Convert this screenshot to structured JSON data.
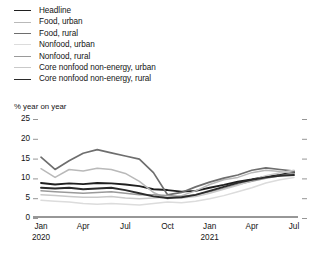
{
  "legend": {
    "items": [
      {
        "label": "Headline",
        "color": "#1f1f1f",
        "width": 1.9
      },
      {
        "label": "Food, urban",
        "color": "#b9b9b9",
        "width": 1.5
      },
      {
        "label": "Food, rural",
        "color": "#6e6e6e",
        "width": 1.7
      },
      {
        "label": "Nonfood, urban",
        "color": "#dcdcdc",
        "width": 1.5
      },
      {
        "label": "Nonfood, rural",
        "color": "#9a9a9a",
        "width": 1.5
      },
      {
        "label": "Core nonfood non-energy, urban",
        "color": "#c9c9c9",
        "width": 1.5
      },
      {
        "label": "Core nonfood non-energy, rural",
        "color": "#2b2b2b",
        "width": 1.9
      }
    ]
  },
  "chart_data": {
    "type": "line",
    "title": "",
    "subtitle": "",
    "ylabel": "% year on year",
    "xlabel": "",
    "ylim": [
      0,
      25
    ],
    "yticks": [
      0,
      5,
      10,
      15,
      20,
      25
    ],
    "grid": false,
    "legend_position": "top-left",
    "x": [
      "Jan 2020",
      "Feb 2020",
      "Mar 2020",
      "Apr 2020",
      "May 2020",
      "Jun 2020",
      "Jul 2020",
      "Aug 2020",
      "Sep 2020",
      "Oct 2020",
      "Nov 2020",
      "Dec 2020",
      "Jan 2021",
      "Feb 2021",
      "Mar 2021",
      "Apr 2021",
      "May 2021",
      "Jun 2021",
      "Jul 2021"
    ],
    "xtick_labels": [
      {
        "top": "Jan",
        "bottom": "2020",
        "index": 0
      },
      {
        "top": "Apr",
        "bottom": "",
        "index": 3
      },
      {
        "top": "Jul",
        "bottom": "",
        "index": 6
      },
      {
        "top": "Oct",
        "bottom": "",
        "index": 9
      },
      {
        "top": "Jan",
        "bottom": "2021",
        "index": 12
      },
      {
        "top": "Apr",
        "bottom": "",
        "index": 15
      },
      {
        "top": "Jul",
        "bottom": "",
        "index": 18
      }
    ],
    "series": [
      {
        "name": "Headline",
        "color": "#1f1f1f",
        "width": 1.9,
        "values": [
          8.6,
          8.2,
          8.5,
          8.3,
          8.6,
          8.5,
          8.2,
          7.8,
          7.0,
          6.8,
          6.4,
          6.6,
          7.4,
          8.1,
          8.9,
          9.5,
          10.2,
          10.6,
          11.3
        ]
      },
      {
        "name": "Food, urban",
        "color": "#b9b9b9",
        "width": 1.5,
        "values": [
          12.2,
          10.0,
          12.0,
          11.6,
          12.3,
          12.0,
          11.0,
          9.0,
          6.2,
          4.6,
          5.4,
          6.6,
          8.2,
          9.4,
          10.0,
          11.2,
          11.8,
          11.5,
          11.0
        ]
      },
      {
        "name": "Food, rural",
        "color": "#6e6e6e",
        "width": 1.7,
        "values": [
          15.1,
          12.0,
          14.2,
          16.1,
          17.0,
          16.2,
          15.4,
          14.6,
          11.2,
          5.6,
          6.2,
          7.6,
          8.8,
          9.8,
          10.6,
          11.8,
          12.4,
          12.0,
          11.6
        ]
      },
      {
        "name": "Nonfood, urban",
        "color": "#dcdcdc",
        "width": 1.5,
        "values": [
          4.2,
          4.0,
          3.8,
          3.4,
          3.2,
          3.4,
          3.2,
          3.0,
          3.4,
          3.8,
          3.6,
          4.0,
          4.6,
          5.4,
          6.4,
          7.4,
          8.6,
          9.4,
          10.0
        ]
      },
      {
        "name": "Nonfood, rural",
        "color": "#9a9a9a",
        "width": 1.5,
        "values": [
          6.6,
          6.4,
          6.2,
          6.0,
          6.2,
          6.4,
          6.0,
          5.6,
          5.6,
          5.4,
          5.2,
          5.6,
          6.4,
          7.2,
          8.2,
          9.0,
          9.8,
          10.4,
          11.0
        ]
      },
      {
        "name": "Core nonfood non-energy, urban",
        "color": "#c9c9c9",
        "width": 1.5,
        "values": [
          5.6,
          5.4,
          5.2,
          5.0,
          5.0,
          5.2,
          4.8,
          4.6,
          4.8,
          5.0,
          4.8,
          5.2,
          6.0,
          7.0,
          8.0,
          9.2,
          10.4,
          11.2,
          11.8
        ]
      },
      {
        "name": "Core nonfood non-energy, rural",
        "color": "#2b2b2b",
        "width": 1.9,
        "values": [
          7.4,
          7.2,
          7.4,
          7.0,
          7.2,
          7.4,
          6.8,
          6.0,
          5.2,
          4.8,
          5.0,
          5.6,
          6.6,
          7.6,
          8.6,
          9.4,
          10.0,
          10.4,
          10.6
        ]
      }
    ]
  }
}
